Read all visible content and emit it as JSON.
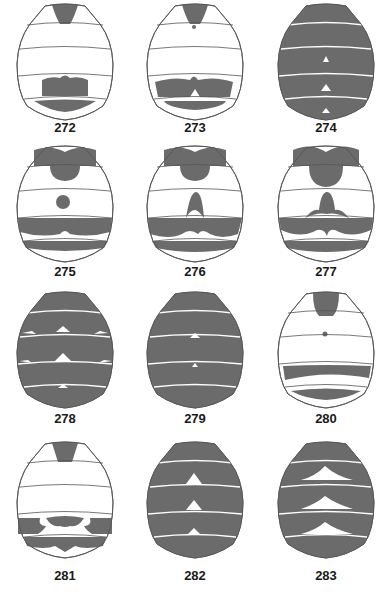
{
  "figure_style": {
    "fill_color": "#6b6b6b",
    "outline_color": "#555555",
    "background": "#ffffff"
  },
  "figures": [
    {
      "label": "272",
      "pattern": "pale; dark basal triangle on T1; dark transverse lobe on T4 with notch, dark band T5"
    },
    {
      "label": "273",
      "pattern": "pale; dark basal triangle T1 with small dot; broad dark area T4 with median white notch; dark band T5"
    },
    {
      "label": "274",
      "pattern": "entirely dark with narrow pale hind margins and small median pale triangles"
    },
    {
      "label": "275",
      "pattern": "dark T1 base and median spot; round median spot T3; dark band T4; dark band T5"
    },
    {
      "label": "276",
      "pattern": "dark T1 base and median spot; median triangle T3; wavy dark band T4; dark band T5"
    },
    {
      "label": "277",
      "pattern": "dark T1 base extended; large median trilobed spot T3; wavy dark band T4; band T5"
    },
    {
      "label": "278",
      "pattern": "mostly dark with pale median and lateral triangles on hind margins"
    },
    {
      "label": "279",
      "pattern": "entirely dark with small median pale triangles"
    },
    {
      "label": "280",
      "pattern": "dark T1 base; small median dot T2; dark band T4; dark band T5"
    },
    {
      "label": "281",
      "pattern": "dark T1 base; T4 dark with lateral lobes and median lobe; dark band T5"
    },
    {
      "label": "282",
      "pattern": "dark with pale hind margins and larger median pale triangles"
    },
    {
      "label": "283",
      "pattern": "dark with broad pale chevron-shaped median marks"
    }
  ]
}
